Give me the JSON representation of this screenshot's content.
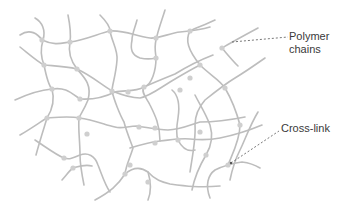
{
  "diagram": {
    "colors": {
      "chain": "#bdbdbd",
      "node": "#cfcfcf",
      "leader": "#555555",
      "text": "#3a3a3a",
      "background": "#ffffff"
    },
    "labels": {
      "polymer_chains_line1": "Polymer",
      "polymer_chains_line2": "chains",
      "cross_link": "Cross-link"
    }
  }
}
